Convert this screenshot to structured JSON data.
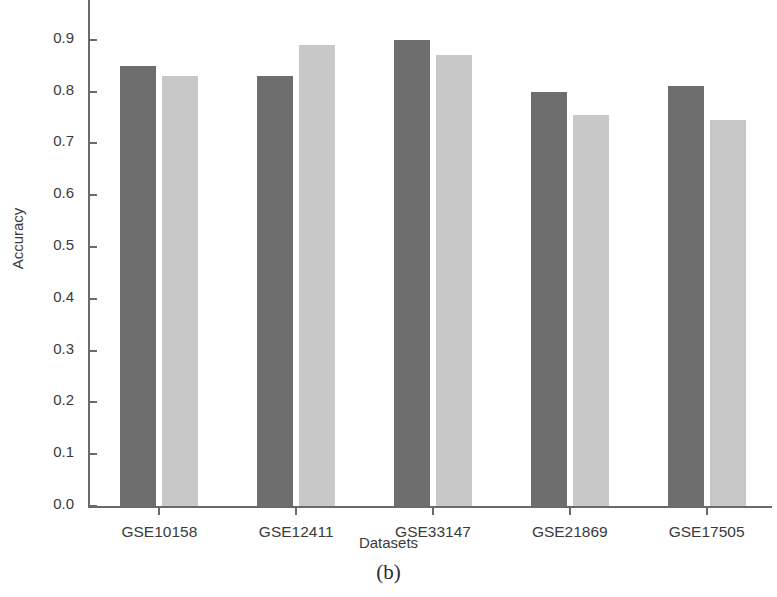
{
  "chart_data": {
    "type": "bar",
    "title": "",
    "subtitle": "",
    "xlabel": "Datasets",
    "ylabel": "Accuracy",
    "caption": "(b)",
    "categories": [
      "GSE10158",
      "GSE12411",
      "GSE33147",
      "GSE21869",
      "GSE17505"
    ],
    "series": [
      {
        "name": "series-1",
        "color": "#6e6e6e",
        "values": [
          0.85,
          0.83,
          0.9,
          0.8,
          0.81
        ]
      },
      {
        "name": "series-2",
        "color": "#c8c8c8",
        "values": [
          0.83,
          0.89,
          0.87,
          0.755,
          0.745
        ]
      }
    ],
    "ylim": [
      0.0,
      1.0
    ],
    "yticks": [
      "0.0",
      "0.1",
      "0.2",
      "0.3",
      "0.4",
      "0.5",
      "0.6",
      "0.7",
      "0.8",
      "0.9",
      "1.0"
    ],
    "ytick_values": [
      0.0,
      0.1,
      0.2,
      0.3,
      0.4,
      0.5,
      0.6,
      0.7,
      0.8,
      0.9,
      1.0
    ],
    "grid": false,
    "legend": "none",
    "axis_color": "#6a6a6a"
  }
}
